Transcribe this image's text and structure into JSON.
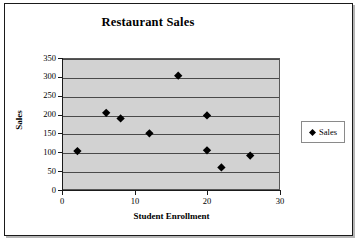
{
  "chart_data": {
    "type": "scatter",
    "title": "Restaurant Sales",
    "xlabel": "Student Enrollment",
    "ylabel": "Sales",
    "xlim": [
      0,
      30
    ],
    "ylim": [
      0,
      350
    ],
    "xticks": [
      0,
      10,
      20,
      30
    ],
    "yticks": [
      0,
      50,
      100,
      150,
      200,
      250,
      300,
      350
    ],
    "grid": "horizontal",
    "legend_position": "right",
    "plot_background": "#d2d2d2",
    "marker": "diamond",
    "marker_color": "#000000",
    "series": [
      {
        "name": "Sales",
        "points": [
          {
            "x": 2,
            "y": 102
          },
          {
            "x": 6,
            "y": 205
          },
          {
            "x": 8,
            "y": 190
          },
          {
            "x": 12,
            "y": 150
          },
          {
            "x": 16,
            "y": 305
          },
          {
            "x": 20,
            "y": 198
          },
          {
            "x": 20,
            "y": 104
          },
          {
            "x": 22,
            "y": 58
          },
          {
            "x": 26,
            "y": 90
          }
        ]
      }
    ]
  },
  "legend": {
    "entries": [
      {
        "label": "Sales",
        "marker": "diamond-marker-icon",
        "color": "#000000"
      }
    ]
  }
}
